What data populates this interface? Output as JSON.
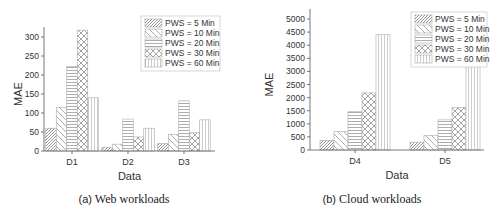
{
  "legend": [
    "PWS = 5 Min",
    "PWS = 10 Min",
    "PWS = 20 Min",
    "PWS = 30 Min",
    "PWS = 60 Min"
  ],
  "chart_data": [
    {
      "type": "bar",
      "title": "(a) Web workloads",
      "caption_prefix": "(a)",
      "caption_text": "Web workloads",
      "xlabel": "Data",
      "ylabel": "MAE",
      "ylim": [
        0,
        330
      ],
      "yticks": [
        0,
        50,
        100,
        150,
        200,
        250,
        300
      ],
      "categories": [
        "D1",
        "D2",
        "D3"
      ],
      "legend_position": "upper right",
      "grid": false,
      "series": [
        {
          "name": "PWS = 5 Min",
          "values": [
            60,
            10,
            20
          ]
        },
        {
          "name": "PWS = 10 Min",
          "values": [
            115,
            18,
            44
          ]
        },
        {
          "name": "PWS = 20 Min",
          "values": [
            222,
            84,
            132
          ]
        },
        {
          "name": "PWS = 30 Min",
          "values": [
            318,
            37,
            48
          ]
        },
        {
          "name": "PWS = 60 Min",
          "values": [
            140,
            60,
            82
          ]
        }
      ]
    },
    {
      "type": "bar",
      "title": "(b) Cloud workloads",
      "caption_prefix": "(b)",
      "caption_text": "Cloud workloads",
      "xlabel": "Data",
      "ylabel": "MAE",
      "ylim": [
        0,
        5000
      ],
      "yticks": [
        0,
        500,
        1000,
        1500,
        2000,
        2500,
        3000,
        3500,
        4000,
        4500,
        5000
      ],
      "categories": [
        "D4",
        "D5"
      ],
      "legend_position": "upper right",
      "grid": false,
      "series": [
        {
          "name": "PWS = 5 Min",
          "values": [
            370,
            300
          ]
        },
        {
          "name": "PWS = 10 Min",
          "values": [
            700,
            560
          ]
        },
        {
          "name": "PWS = 20 Min",
          "values": [
            1460,
            1150
          ]
        },
        {
          "name": "PWS = 30 Min",
          "values": [
            2180,
            1620
          ]
        },
        {
          "name": "PWS = 60 Min",
          "values": [
            4400,
            3300
          ]
        }
      ]
    }
  ]
}
